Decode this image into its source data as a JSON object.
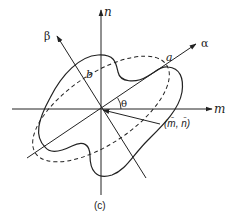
{
  "figure": {
    "caption": "(c)",
    "axes": {
      "m": {
        "label": "m"
      },
      "n": {
        "label": "n"
      },
      "alpha": {
        "label": "α"
      },
      "beta": {
        "label": "β"
      }
    },
    "labels": {
      "a": "a",
      "b": "b",
      "theta": "θ",
      "centroid": "(m̄, n̄)"
    },
    "colors": {
      "stroke": "#222222",
      "background": "#ffffff"
    }
  }
}
